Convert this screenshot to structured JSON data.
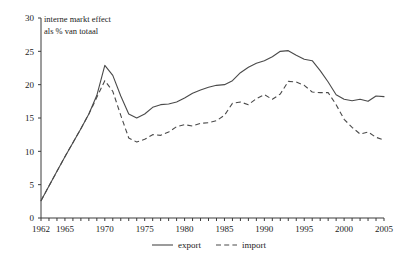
{
  "chart_data": {
    "type": "line",
    "title": "interne markt effect",
    "subtitle": "als % van totaal",
    "xlabel": "",
    "ylabel": "",
    "xlim": [
      1962,
      2005
    ],
    "ylim": [
      0,
      30
    ],
    "yticks": [
      0,
      5,
      10,
      15,
      20,
      25,
      30
    ],
    "ytick_labels": [
      "0",
      "5",
      "10",
      "15",
      "20",
      "25",
      "30"
    ],
    "xticks": [
      1962,
      1965,
      1970,
      1975,
      1980,
      1985,
      1990,
      1995,
      2000,
      2005
    ],
    "xtick_labels": [
      "1962",
      "1965",
      "1970",
      "1975",
      "1980",
      "1985",
      "1990",
      "1995",
      "2000",
      "2005"
    ],
    "minor_xticks_every": 1,
    "grid": false,
    "legend_position": "bottom-center",
    "x": [
      1962,
      1963,
      1964,
      1965,
      1966,
      1967,
      1968,
      1969,
      1970,
      1971,
      1972,
      1973,
      1974,
      1975,
      1976,
      1977,
      1978,
      1979,
      1980,
      1981,
      1982,
      1983,
      1984,
      1985,
      1986,
      1987,
      1988,
      1989,
      1990,
      1991,
      1992,
      1993,
      1994,
      1995,
      1996,
      1997,
      1998,
      1999,
      2000,
      2001,
      2002,
      2003,
      2004,
      2005
    ],
    "series": [
      {
        "name": "export",
        "style": "solid",
        "color": "#4a4a4a",
        "values": [
          2.6,
          4.8,
          7.0,
          9.2,
          11.3,
          13.4,
          15.6,
          18.4,
          22.9,
          21.4,
          18.3,
          15.6,
          15.0,
          15.6,
          16.6,
          17.0,
          17.1,
          17.4,
          18.0,
          18.7,
          19.2,
          19.6,
          19.9,
          20.0,
          20.6,
          21.8,
          22.6,
          23.2,
          23.6,
          24.2,
          25.0,
          25.1,
          24.4,
          23.8,
          23.6,
          22.1,
          20.4,
          18.5,
          17.8,
          17.6,
          17.8,
          17.5,
          18.3,
          18.2
        ]
      },
      {
        "name": "import",
        "style": "dashed",
        "color": "#4a4a4a",
        "values": [
          2.6,
          4.8,
          7.0,
          9.2,
          11.3,
          13.4,
          15.6,
          18.1,
          20.6,
          19.0,
          15.4,
          12.0,
          11.4,
          11.8,
          12.5,
          12.4,
          12.9,
          13.7,
          14.0,
          13.8,
          14.2,
          14.3,
          14.6,
          15.4,
          17.2,
          17.4,
          17.0,
          17.9,
          18.5,
          17.8,
          18.6,
          20.5,
          20.4,
          19.9,
          18.9,
          18.8,
          18.8,
          17.0,
          14.8,
          13.6,
          12.6,
          12.9,
          12.1,
          11.7
        ]
      }
    ]
  },
  "legend": {
    "items": [
      {
        "label": "export",
        "style": "solid"
      },
      {
        "label": "import",
        "style": "dashed"
      }
    ]
  }
}
